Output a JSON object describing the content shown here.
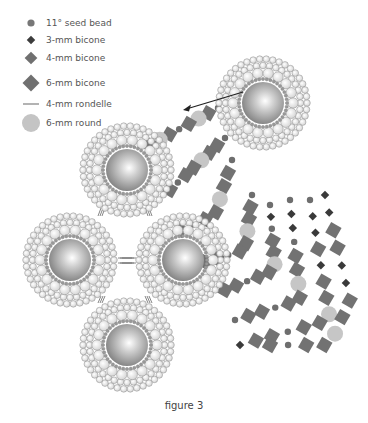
{
  "legend": {
    "items": [
      {
        "label": "11° seed bead",
        "symbol": "seed-bead",
        "color": "#777777"
      },
      {
        "label": "3-mm bicone",
        "symbol": "bicone-3mm",
        "color": "#3c3c3c"
      },
      {
        "label": "4-mm bicone",
        "symbol": "bicone-4mm",
        "color": "#707070"
      },
      {
        "label": "6-mm bicone",
        "symbol": "bicone-6mm",
        "color": "#707070"
      },
      {
        "label": "4-mm rondelle",
        "symbol": "rondelle-4mm",
        "color": "#9a9a9a"
      },
      {
        "label": "6-mm round",
        "symbol": "round-6mm",
        "color": "#c4c4c4"
      }
    ]
  },
  "figure": {
    "caption": "figure 3",
    "medallions": [
      {
        "name": "top",
        "cx": 127,
        "cy": 170
      },
      {
        "name": "left",
        "cx": 70,
        "cy": 260
      },
      {
        "name": "right",
        "cx": 183,
        "cy": 260
      },
      {
        "name": "bottom",
        "cx": 127,
        "cy": 345
      },
      {
        "name": "upper-right",
        "cx": 263,
        "cy": 103
      }
    ],
    "arrow": {
      "x1": 243,
      "y1": 92,
      "x2": 183,
      "y2": 110
    }
  }
}
